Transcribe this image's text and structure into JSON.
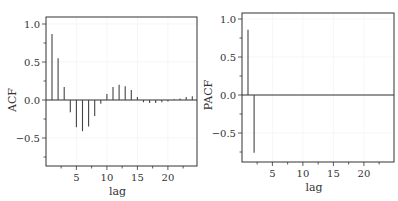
{
  "chart_data": [
    {
      "type": "bar",
      "subtype": "stem",
      "title": "",
      "xlabel": "lag",
      "ylabel": "ACF",
      "x": [
        1,
        2,
        3,
        4,
        5,
        6,
        7,
        8,
        9,
        10,
        11,
        12,
        13,
        14,
        15,
        16,
        17,
        18,
        19,
        20,
        21,
        22,
        23,
        24
      ],
      "values": [
        0.87,
        0.55,
        0.17,
        -0.16,
        -0.36,
        -0.41,
        -0.35,
        -0.21,
        -0.05,
        0.08,
        0.17,
        0.2,
        0.18,
        0.13,
        0.04,
        -0.03,
        -0.04,
        -0.04,
        -0.03,
        -0.02,
        0.01,
        0.02,
        0.04,
        0.05
      ],
      "xticks": [
        5,
        10,
        15,
        20
      ],
      "yticks": [
        -0.5,
        0.0,
        0.5,
        1.0
      ],
      "ytick_labels": [
        "−0.5",
        "0.0",
        "0.5",
        "1.0"
      ],
      "xlim": [
        0.2,
        24.6
      ],
      "ylim": [
        -0.87,
        1.1
      ],
      "zero_line": true,
      "grid": true
    },
    {
      "type": "bar",
      "subtype": "stem",
      "title": "",
      "xlabel": "lag",
      "ylabel": "PACF",
      "x": [
        1,
        2
      ],
      "values": [
        0.86,
        -0.76
      ],
      "xticks": [
        5,
        10,
        15,
        20
      ],
      "yticks": [
        -0.5,
        0.0,
        0.5,
        1.0
      ],
      "ytick_labels": [
        "−0.5",
        "0.0",
        "0.5",
        "1.0"
      ],
      "xlim": [
        0.2,
        24.6
      ],
      "ylim": [
        -0.87,
        1.1
      ],
      "zero_line": true,
      "grid": true
    }
  ],
  "panels": [
    {
      "box": {
        "left": 46,
        "top": 17,
        "right": 197,
        "bottom": 166
      },
      "zeroY": 100,
      "unitPx": 76,
      "lag1X": 52,
      "lagPx": 6.1
    },
    {
      "box": {
        "left": 242,
        "top": 13,
        "right": 394,
        "bottom": 162
      },
      "zeroY": 95,
      "unitPx": 76,
      "lag1X": 248,
      "lagPx": 6.1
    }
  ]
}
